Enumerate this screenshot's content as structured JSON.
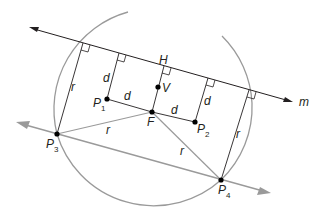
{
  "diagram": {
    "type": "parabola-construction",
    "colors": {
      "ink": "#231f20",
      "gray": "#9a9a9a",
      "background": "#ffffff"
    },
    "line": {
      "label": "m"
    },
    "points": {
      "H": {
        "label": "H"
      },
      "V": {
        "label": "V"
      },
      "F": {
        "label": "F"
      },
      "P1": {
        "label": "P",
        "sub": "1"
      },
      "P2": {
        "label": "P",
        "sub": "2"
      },
      "P3": {
        "label": "P",
        "sub": "3"
      },
      "P4": {
        "label": "P",
        "sub": "4"
      }
    },
    "segment_labels": {
      "d_p1_perp": "d",
      "d_p1_f": "d",
      "d_f_p2": "d",
      "d_p2_perp": "d",
      "r_p3_perp": "r",
      "r_p3_f": "r",
      "r_f_p4": "r",
      "r_p4_perp": "r"
    }
  }
}
